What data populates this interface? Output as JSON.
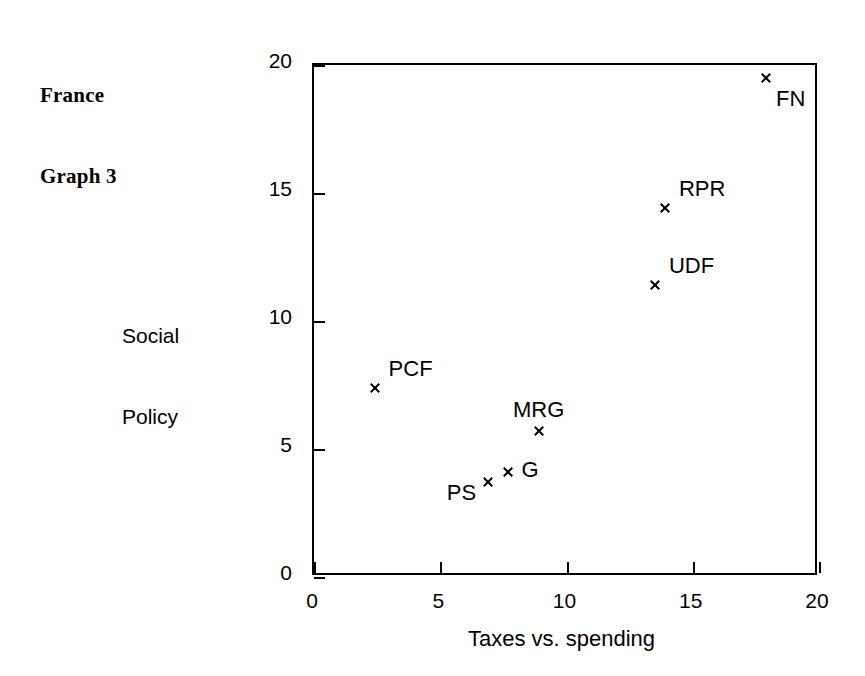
{
  "figure": {
    "title_lines": [
      "France",
      "Graph 3"
    ],
    "title_line_1": "France",
    "title_line_2": "Graph 3",
    "background_color": "#ffffff",
    "ink_color": "#000000"
  },
  "chart_data": {
    "type": "scatter",
    "title": "France Graph 3",
    "xlabel": "Taxes vs. spending",
    "ylabel": "Social Policy",
    "ylabel_lines": [
      "Social",
      "Policy"
    ],
    "ylabel_line_1": "Social",
    "ylabel_line_2": "Policy",
    "xlim": [
      0,
      20
    ],
    "ylim": [
      0,
      20
    ],
    "xticks": [
      0,
      5,
      10,
      15,
      20
    ],
    "yticks": [
      0,
      5,
      10,
      15,
      20
    ],
    "xtick_labels": [
      "0",
      "5",
      "10",
      "15",
      "20"
    ],
    "ytick_labels": [
      "0",
      "5",
      "10",
      "15",
      "20"
    ],
    "grid": false,
    "legend": false,
    "marker_symbol": "x",
    "marker_color": "#000000",
    "points": [
      {
        "label": "FN",
        "x": 17.9,
        "y": 19.5,
        "label_pos": "below-right"
      },
      {
        "label": "RPR",
        "x": 13.9,
        "y": 14.4,
        "label_pos": "above-right"
      },
      {
        "label": "UDF",
        "x": 13.5,
        "y": 11.4,
        "label_pos": "above-right"
      },
      {
        "label": "PCF",
        "x": 2.4,
        "y": 7.4,
        "label_pos": "above-right"
      },
      {
        "label": "MRG",
        "x": 8.9,
        "y": 5.7,
        "label_pos": "above"
      },
      {
        "label": "G",
        "x": 7.7,
        "y": 4.1,
        "label_pos": "right"
      },
      {
        "label": "PS",
        "x": 6.9,
        "y": 3.7,
        "label_pos": "left-below"
      }
    ]
  }
}
